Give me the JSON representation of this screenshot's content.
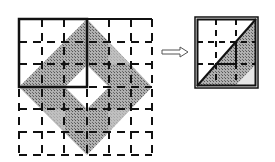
{
  "diagram": {
    "left_figure": {
      "grid_cells": 6,
      "shape": "diamond-band",
      "inner_hole": "diamond",
      "highlighted_quadrant": "top-left"
    },
    "arrow": {
      "direction": "right",
      "style": "hollow"
    },
    "right_figure": {
      "grid_cells": 3,
      "shape": "shaded lower-right triangle with inner white step",
      "border": "double"
    },
    "colors": {
      "shade": "#9a9a9a",
      "shade_light": "#c4c4c4",
      "line": "#111111",
      "background": "#ffffff"
    }
  }
}
